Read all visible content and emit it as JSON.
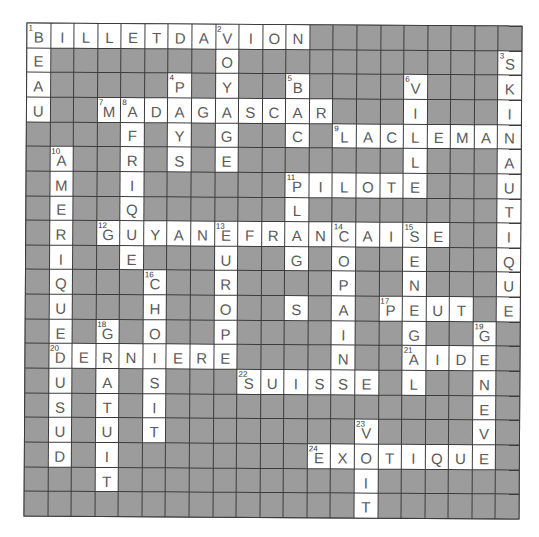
{
  "puzzle": {
    "type": "crossword",
    "rows": 20,
    "cols": 21,
    "block_char": "#",
    "colors": {
      "block": "#9c9c9c",
      "open": "#ffffff",
      "grid_line": "#3c3c3c",
      "letter": "#5a5a5a"
    },
    "grid": [
      "BILLETDAVION#########",
      "E#######O###########S",
      "A#####P#Y##B####V###K",
      "U##MADAGASCAR###I###I",
      "####F#Y#G##C#LACLEMAN",
      "#A##R#S#E#######L###A",
      "#M##I######PILOTE###U",
      "#E##Q######L########T",
      "#R#GUYANEFRANCAISE##I",
      "#I##E###U##G#O##E###Q",
      "#Q###C##R####P##N###U",
      "#U###H##O##S#A#PEUT#E",
      "#E#G#O##P####I##G##G#",
      "#DERNIERE####N##AIDE#",
      "#U#A#S###SUISSE#L##N#",
      "#S#T#I#############E#",
      "#U#U#T########V####V#",
      "#D#I########EXOTIQUE#",
      "###T##########I######",
      "##############T######"
    ],
    "numbers": [
      {
        "n": "1",
        "r": 0,
        "c": 0
      },
      {
        "n": "2",
        "r": 0,
        "c": 8
      },
      {
        "n": "3",
        "r": 1,
        "c": 20
      },
      {
        "n": "4",
        "r": 2,
        "c": 6
      },
      {
        "n": "5",
        "r": 2,
        "c": 11
      },
      {
        "n": "6",
        "r": 2,
        "c": 16
      },
      {
        "n": "7",
        "r": 3,
        "c": 3
      },
      {
        "n": "8",
        "r": 3,
        "c": 4
      },
      {
        "n": "9",
        "r": 4,
        "c": 13
      },
      {
        "n": "10",
        "r": 5,
        "c": 1
      },
      {
        "n": "11",
        "r": 6,
        "c": 11
      },
      {
        "n": "12",
        "r": 8,
        "c": 3
      },
      {
        "n": "13",
        "r": 8,
        "c": 8
      },
      {
        "n": "14",
        "r": 8,
        "c": 13
      },
      {
        "n": "15",
        "r": 8,
        "c": 16
      },
      {
        "n": "16",
        "r": 10,
        "c": 5
      },
      {
        "n": "17",
        "r": 11,
        "c": 15
      },
      {
        "n": "18",
        "r": 12,
        "c": 3
      },
      {
        "n": "19",
        "r": 12,
        "c": 19
      },
      {
        "n": "20",
        "r": 13,
        "c": 1
      },
      {
        "n": "21",
        "r": 13,
        "c": 16
      },
      {
        "n": "22",
        "r": 14,
        "c": 9
      },
      {
        "n": "23",
        "r": 16,
        "c": 14
      },
      {
        "n": "24",
        "r": 17,
        "c": 12
      }
    ],
    "answers": {
      "across": [
        {
          "n": "1",
          "word": "BILLETDAVION"
        },
        {
          "n": "7",
          "word": "MADAGASCAR"
        },
        {
          "n": "9",
          "word": "LACLEMAN"
        },
        {
          "n": "11",
          "word": "PILOTE"
        },
        {
          "n": "12",
          "word": "GUYANEFRANCAISE"
        },
        {
          "n": "17",
          "word": "PEUT"
        },
        {
          "n": "20",
          "word": "DERNIERE"
        },
        {
          "n": "21",
          "word": "AIDE"
        },
        {
          "n": "22",
          "word": "SUISSE"
        },
        {
          "n": "24",
          "word": "EXOTIQUE"
        }
      ],
      "down": [
        {
          "n": "1",
          "word": "BEAU"
        },
        {
          "n": "2",
          "word": "VOYAGE"
        },
        {
          "n": "3",
          "word": "SKINAUTIQUE"
        },
        {
          "n": "4",
          "word": "PAYS"
        },
        {
          "n": "5",
          "word": "BAC"
        },
        {
          "n": "6",
          "word": "VILLE"
        },
        {
          "n": "8",
          "word": "AFRIQUE"
        },
        {
          "n": "10",
          "word": "AMERIQUEDUSUD"
        },
        {
          "n": "11",
          "word": "PLAGES"
        },
        {
          "n": "13",
          "word": "EUROPE"
        },
        {
          "n": "14",
          "word": "COPAIN"
        },
        {
          "n": "15",
          "word": "SENEGAL"
        },
        {
          "n": "16",
          "word": "CHOISIT"
        },
        {
          "n": "18",
          "word": "GRATUIT"
        },
        {
          "n": "19",
          "word": "GENEVE"
        },
        {
          "n": "23",
          "word": "VOIT"
        }
      ]
    }
  }
}
